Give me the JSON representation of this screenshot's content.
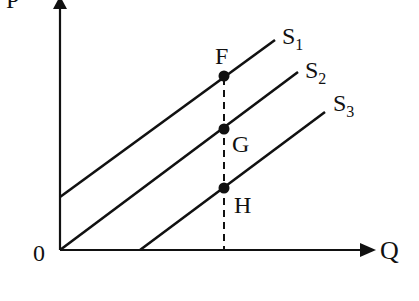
{
  "diagram": {
    "type": "supply-shift-diagram",
    "axes": {
      "y_label": "P",
      "x_label": "Q",
      "origin_label": "0"
    },
    "curves": [
      {
        "name": "S",
        "subscript": "1",
        "x1": 60,
        "y1": 197,
        "x2": 275,
        "y2": 40
      },
      {
        "name": "S",
        "subscript": "2",
        "x1": 60,
        "y1": 250,
        "x2": 298,
        "y2": 72
      },
      {
        "name": "S",
        "subscript": "3",
        "x1": 140,
        "y1": 250,
        "x2": 325,
        "y2": 112
      }
    ],
    "points": [
      {
        "label": "F",
        "x": 224,
        "y": 76
      },
      {
        "label": "G",
        "x": 224,
        "y": 129
      },
      {
        "label": "H",
        "x": 224,
        "y": 188
      }
    ],
    "dashed_line": {
      "x": 224,
      "y_top": 76,
      "y_bottom": 250
    },
    "colors": {
      "ink": "#111111",
      "background": "#ffffff"
    }
  }
}
